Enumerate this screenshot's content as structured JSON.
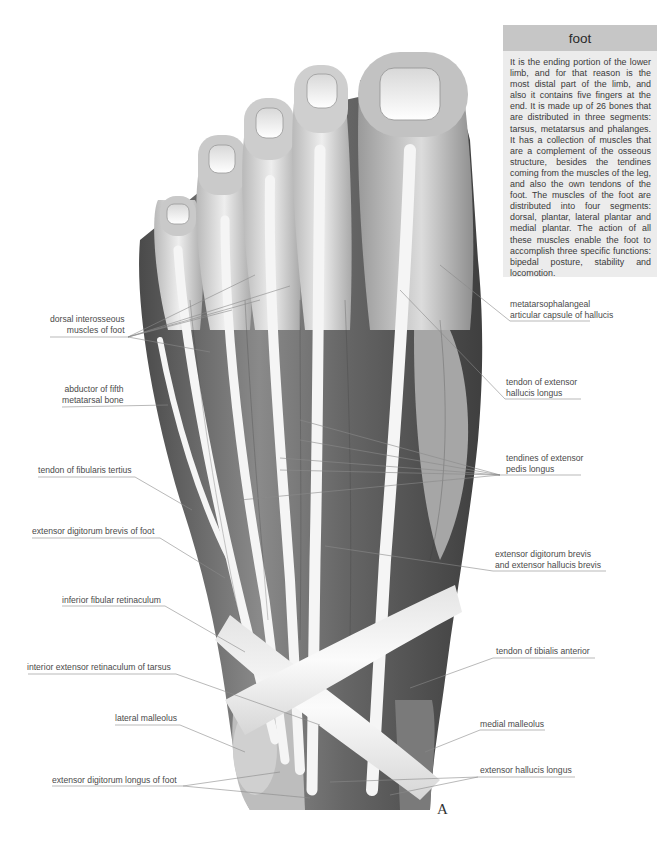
{
  "info_box": {
    "title": "foot",
    "body": "It is the ending portion of the lower limb, and for that reason is the most distal part of the limb, and also it contains five fingers at the end. It is made up of 26 bones that are distributed in three segments: tarsus, metatarsus and phalanges. It has a collection of muscles that are a complement of the osseous structure, besides the tendines coming from the muscles of the leg, and also the own tendons of the foot. The muscles of the foot are distributed into four segments: dorsal, plantar, lateral plantar and medial plantar. The action of all these muscles enable the foot to accomplish three specific functions: bipedal posture, stability and locomotion."
  },
  "labels_left": [
    {
      "line1": "dorsal interosseous",
      "line2": "muscles of foot"
    },
    {
      "line1": "abductor of fifth",
      "line2": "metatarsal bone"
    },
    {
      "line1": "tendon of fibularis tertius"
    },
    {
      "line1": "extensor digitorum brevis of foot"
    },
    {
      "line1": "inferior fibular retinaculum"
    },
    {
      "line1": "interior extensor retinaculum of tarsus"
    },
    {
      "line1": "lateral malleolus"
    },
    {
      "line1": "extensor digitorum longus of foot"
    }
  ],
  "labels_right": [
    {
      "line1": "metatarsophalangeal",
      "line2": "articular capsule of hallucis"
    },
    {
      "line1": "tendon of extensor",
      "line2": "hallucis longus"
    },
    {
      "line1": "tendines of extensor",
      "line2": "pedis longus"
    },
    {
      "line1": "extensor digitorum brevis",
      "line2": "and extensor hallucis brevis"
    },
    {
      "line1": "tendon of tibialis anterior"
    },
    {
      "line1": "medial malleolus"
    },
    {
      "line1": "extensor hallucis longus"
    }
  ],
  "plate_letter": "A",
  "colors": {
    "info_header": "#c6c6c6",
    "info_body": "#ececec",
    "leader_line": "#8a8a8a",
    "muscle_dark": "#5a5a5a",
    "tendon_light": "#f4f4f4"
  }
}
